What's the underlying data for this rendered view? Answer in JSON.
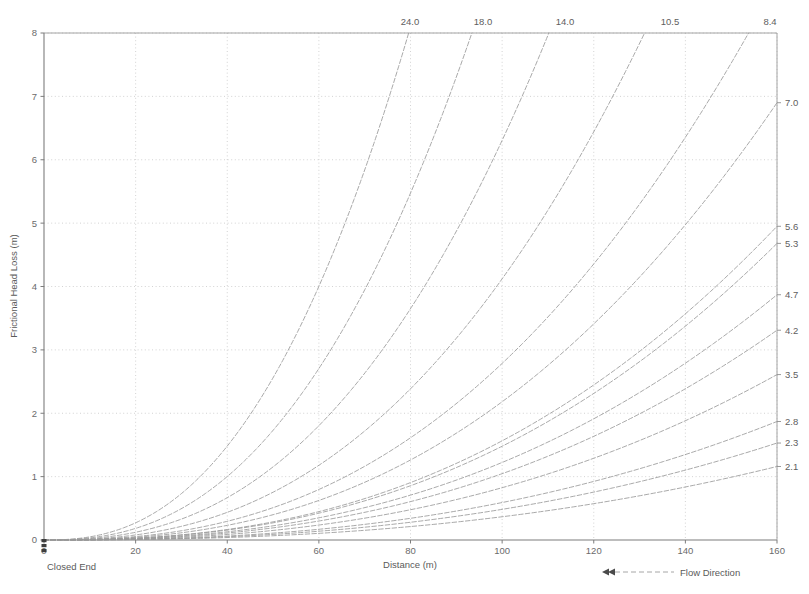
{
  "chart_data": {
    "type": "line",
    "title": "",
    "xlabel": "Distance (m)",
    "ylabel": "Frictional Head Loss (m)",
    "xlim": [
      0,
      160
    ],
    "ylim": [
      0,
      8
    ],
    "xticks": [
      0,
      20,
      40,
      60,
      80,
      100,
      120,
      140,
      160
    ],
    "yticks": [
      0,
      1,
      2,
      3,
      4,
      5,
      6,
      7,
      8
    ],
    "grid": true,
    "legend_position": "bottom-right",
    "annotations": {
      "origin_note": "Closed End",
      "flow_direction": "Flow Direction",
      "flow_arrow": "double-arrow-left"
    },
    "top_axis_labels": [
      {
        "label": "24.0",
        "x_px": 410
      },
      {
        "label": "18.0",
        "x_px": 483
      },
      {
        "label": "14.0",
        "x_px": 565
      },
      {
        "label": "10.5",
        "x_px": 670
      },
      {
        "label": "8.4",
        "x_px": 770
      }
    ],
    "right_axis_labels": [
      {
        "label": "7.0",
        "y_value": 6.9
      },
      {
        "label": "5.6",
        "y_value": 4.95
      },
      {
        "label": "5.3",
        "y_value": 4.68
      },
      {
        "label": "4.7",
        "y_value": 3.87
      },
      {
        "label": "4.2",
        "y_value": 3.31
      },
      {
        "label": "3.5",
        "y_value": 2.61
      },
      {
        "label": "2.8",
        "y_value": 1.87
      },
      {
        "label": "2.3",
        "y_value": 1.53
      },
      {
        "label": "2.1",
        "y_value": 1.16
      }
    ],
    "series": [
      {
        "name": "24.0",
        "end_label": "24.0",
        "exits_top": true,
        "x_at_top": 79.6,
        "end_y": 8.0
      },
      {
        "name": "18.0",
        "end_label": "18.0",
        "exits_top": true,
        "x_at_top": 93.4,
        "end_y": 8.0
      },
      {
        "name": "14.0",
        "end_label": "14.0",
        "exits_top": true,
        "x_at_top": 110.2,
        "end_y": 8.0
      },
      {
        "name": "10.5",
        "end_label": "10.5",
        "exits_top": true,
        "x_at_top": 131.1,
        "end_y": 8.0
      },
      {
        "name": "8.4",
        "end_label": "8.4",
        "exits_top": true,
        "x_at_top": 153.8,
        "end_y": 8.0
      },
      {
        "name": "7.0",
        "end_label": "7.0",
        "exits_top": false,
        "x_at_top": 0,
        "end_y": 6.9
      },
      {
        "name": "5.6",
        "end_label": "5.6",
        "exits_top": false,
        "x_at_top": 0,
        "end_y": 4.95
      },
      {
        "name": "5.3",
        "end_label": "5.3",
        "exits_top": false,
        "x_at_top": 0,
        "end_y": 4.68
      },
      {
        "name": "4.7",
        "end_label": "4.7",
        "exits_top": false,
        "x_at_top": 0,
        "end_y": 3.87
      },
      {
        "name": "4.2",
        "end_label": "4.2",
        "exits_top": false,
        "x_at_top": 0,
        "end_y": 3.31
      },
      {
        "name": "3.5",
        "end_label": "3.5",
        "exits_top": false,
        "x_at_top": 0,
        "end_y": 2.61
      },
      {
        "name": "2.8",
        "end_label": "2.8",
        "exits_top": false,
        "x_at_top": 0,
        "end_y": 1.87
      },
      {
        "name": "2.3",
        "end_label": "2.3",
        "exits_top": false,
        "x_at_top": 0,
        "end_y": 1.53
      },
      {
        "name": "2.1",
        "end_label": "2.1",
        "exits_top": false,
        "x_at_top": 0,
        "end_y": 1.16
      }
    ]
  },
  "colors": {
    "axis": "#808080",
    "grid": "#c8c8c8",
    "curve": "#9a9a9a",
    "text": "#5a5a5a",
    "background": "#ffffff"
  }
}
